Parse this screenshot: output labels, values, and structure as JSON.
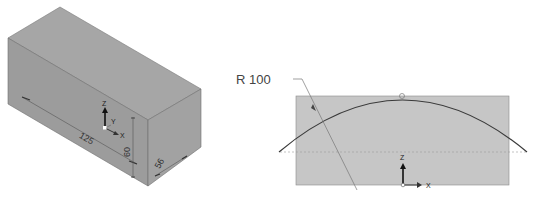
{
  "figure_left": {
    "type": "isometric-box",
    "dimensions": {
      "length": "125",
      "height": "60",
      "depth": "56"
    },
    "axis_labels": {
      "z": "Z",
      "x": "X",
      "y": "Y"
    },
    "colors": {
      "top_face": "#a6a6a6",
      "front_face": "#9c9c9c",
      "side_face": "#a2a2a2",
      "edges": "#6a6a6a"
    }
  },
  "figure_right": {
    "type": "sketch-arc",
    "radius_label": "R 100",
    "axis_labels": {
      "z": "Z",
      "x": "X"
    },
    "colors": {
      "rect_fill": "#c6c6c6",
      "arc": "#3a3a3a",
      "leader": "#777777",
      "centerline": "#9a9a9a"
    }
  }
}
